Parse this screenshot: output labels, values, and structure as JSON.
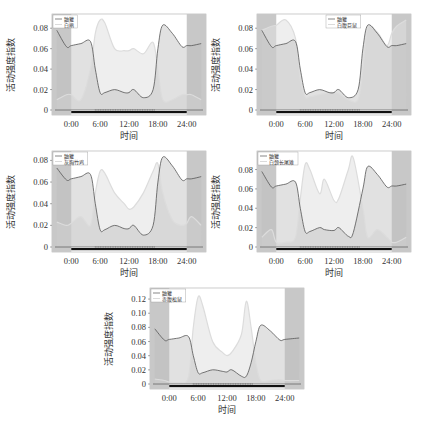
{
  "figure": {
    "ylabel": "活动强度指数",
    "xlabel": "时间",
    "x_ticks": [
      "0:00",
      "6:00",
      "12:00",
      "18:00",
      "24:00"
    ],
    "colors": {
      "night_shade": "#c8c8c8",
      "plot_bg": "#ffffff",
      "reference_line": "#555555",
      "reference_fill": "#bdbdbd",
      "species_line": "#e6e6e6",
      "species_fill": "#e0e0e0",
      "rug": "#111111"
    }
  },
  "chart_data": [
    {
      "type": "line",
      "title": "",
      "xlabel": "时间",
      "ylabel": "活动强度指数",
      "ylim": [
        0,
        0.09
      ],
      "y_ticks": [
        "0",
        "0.02",
        "0.04",
        "0.06",
        "0.08"
      ],
      "x_ticks": [
        "0:00",
        "6:00",
        "12:00",
        "18:00",
        "24:00"
      ],
      "legend": [
        "鼬獾",
        "白鹇"
      ],
      "legend_position": "upper-left",
      "x_hours": [
        -3,
        -1,
        0,
        2,
        4,
        5,
        6,
        7,
        9,
        11,
        12,
        13,
        15,
        17,
        18,
        19,
        21,
        23,
        24,
        25,
        27
      ],
      "series": [
        {
          "name": "鼬獾",
          "values": [
            0.078,
            0.062,
            0.063,
            0.065,
            0.067,
            0.04,
            0.017,
            0.017,
            0.02,
            0.017,
            0.017,
            0.02,
            0.012,
            0.02,
            0.06,
            0.083,
            0.075,
            0.062,
            0.063,
            0.063,
            0.065
          ]
        },
        {
          "name": "白鹇",
          "values": [
            0.01,
            0.015,
            0.015,
            0.01,
            0.04,
            0.075,
            0.088,
            0.085,
            0.06,
            0.058,
            0.058,
            0.06,
            0.055,
            0.066,
            0.04,
            0.01,
            0.01,
            0.015,
            0.015,
            0.015,
            0.01
          ]
        }
      ]
    },
    {
      "type": "line",
      "title": "",
      "xlabel": "时间",
      "ylabel": "活动强度指数",
      "ylim": [
        0,
        0.09
      ],
      "y_ticks": [
        "0",
        "0.02",
        "0.04",
        "0.06",
        "0.08"
      ],
      "x_ticks": [
        "0:00",
        "6:00",
        "12:00",
        "18:00",
        "24:00"
      ],
      "legend": [
        "鼬獾",
        "白腹巨鼠"
      ],
      "legend_position": "upper-center",
      "x_hours": [
        -3,
        -1,
        0,
        2,
        4,
        5,
        6,
        7,
        9,
        11,
        12,
        13,
        15,
        17,
        18,
        19,
        21,
        23,
        24,
        25,
        27
      ],
      "series": [
        {
          "name": "鼬獾",
          "values": [
            0.078,
            0.062,
            0.063,
            0.065,
            0.067,
            0.04,
            0.017,
            0.017,
            0.02,
            0.017,
            0.017,
            0.02,
            0.012,
            0.02,
            0.06,
            0.083,
            0.075,
            0.062,
            0.063,
            0.063,
            0.065
          ]
        },
        {
          "name": "白腹巨鼠",
          "values": [
            0.078,
            0.082,
            0.083,
            0.088,
            0.07,
            0.03,
            0.013,
            0.013,
            0.015,
            0.017,
            0.017,
            0.016,
            0.01,
            0.01,
            0.04,
            0.08,
            0.076,
            0.063,
            0.075,
            0.082,
            0.088
          ]
        }
      ]
    },
    {
      "type": "line",
      "title": "",
      "xlabel": "时间",
      "ylabel": "活动强度指数",
      "ylim": [
        0,
        0.085
      ],
      "y_ticks": [
        "0",
        "0.02",
        "0.04",
        "0.06",
        "0.08"
      ],
      "x_ticks": [
        "0:00",
        "6:00",
        "12:00",
        "18:00",
        "24:00"
      ],
      "legend": [
        "鼬獾",
        "灰胸竹鸡"
      ],
      "legend_position": "upper-left",
      "x_hours": [
        -3,
        -1,
        0,
        2,
        4,
        5,
        6,
        7,
        9,
        11,
        12,
        13,
        15,
        17,
        18,
        19,
        21,
        23,
        24,
        25,
        27
      ],
      "series": [
        {
          "name": "鼬獾",
          "values": [
            0.073,
            0.062,
            0.063,
            0.065,
            0.067,
            0.04,
            0.016,
            0.016,
            0.02,
            0.017,
            0.017,
            0.02,
            0.011,
            0.02,
            0.06,
            0.083,
            0.075,
            0.062,
            0.063,
            0.063,
            0.065
          ]
        },
        {
          "name": "灰胸竹鸡",
          "values": [
            0.023,
            0.02,
            0.022,
            0.028,
            0.02,
            0.05,
            0.07,
            0.068,
            0.05,
            0.04,
            0.035,
            0.037,
            0.05,
            0.07,
            0.077,
            0.05,
            0.025,
            0.02,
            0.022,
            0.028,
            0.02
          ]
        }
      ]
    },
    {
      "type": "line",
      "title": "",
      "xlabel": "时间",
      "ylabel": "活动强度指数",
      "ylim": [
        0,
        0.095
      ],
      "y_ticks": [
        "0",
        "0.02",
        "0.04",
        "0.06",
        "0.08"
      ],
      "x_ticks": [
        "0:00",
        "6:00",
        "12:00",
        "18:00",
        "24:00"
      ],
      "legend": [
        "鼬獾",
        "白颈长尾雉"
      ],
      "legend_position": "upper-left",
      "x_hours": [
        -3,
        -1,
        0,
        2,
        4,
        5,
        6,
        7,
        9,
        10,
        12,
        13,
        15,
        16,
        18,
        19,
        21,
        23,
        24,
        25,
        27
      ],
      "series": [
        {
          "name": "鼬獾",
          "values": [
            0.078,
            0.062,
            0.063,
            0.065,
            0.067,
            0.04,
            0.016,
            0.016,
            0.02,
            0.018,
            0.017,
            0.02,
            0.011,
            0.015,
            0.06,
            0.083,
            0.075,
            0.062,
            0.063,
            0.063,
            0.065
          ]
        },
        {
          "name": "白颈长尾雉",
          "values": [
            0.01,
            0.018,
            0.005,
            0.005,
            0.01,
            0.05,
            0.085,
            0.08,
            0.055,
            0.07,
            0.048,
            0.05,
            0.08,
            0.092,
            0.04,
            0.01,
            0.018,
            0.01,
            0.005,
            0.005,
            0.01
          ]
        }
      ]
    },
    {
      "type": "line",
      "title": "",
      "xlabel": "时间",
      "ylabel": "活动强度指数",
      "ylim": [
        0,
        0.13
      ],
      "y_ticks": [
        "0",
        "0.02",
        "0.04",
        "0.06",
        "0.08",
        "0.10",
        "0.12"
      ],
      "x_ticks": [
        "0:00",
        "6:00",
        "12:00",
        "18:00",
        "24:00"
      ],
      "legend": [
        "鼬獾",
        "赤腹松鼠"
      ],
      "legend_position": "upper-left",
      "x_hours": [
        -3,
        -1,
        0,
        2,
        4,
        5,
        6,
        7,
        9,
        11,
        12,
        13,
        15,
        16,
        17,
        18,
        19,
        21,
        23,
        24,
        27
      ],
      "series": [
        {
          "name": "鼬獾",
          "values": [
            0.078,
            0.062,
            0.063,
            0.065,
            0.067,
            0.04,
            0.016,
            0.016,
            0.02,
            0.018,
            0.017,
            0.02,
            0.011,
            0.011,
            0.03,
            0.06,
            0.083,
            0.075,
            0.062,
            0.063,
            0.065
          ]
        },
        {
          "name": "赤腹松鼠",
          "values": [
            0.007,
            0.005,
            0.003,
            0.002,
            0.01,
            0.08,
            0.123,
            0.11,
            0.06,
            0.045,
            0.04,
            0.045,
            0.07,
            0.117,
            0.08,
            0.03,
            0.005,
            0.005,
            0.006,
            0.005,
            0.005
          ]
        }
      ]
    }
  ],
  "panels": [
    {
      "legend": {
        "reference": "鼬獾",
        "species": "白鹇"
      }
    },
    {
      "legend": {
        "reference": "鼬獾",
        "species": "白腹巨鼠"
      }
    },
    {
      "legend": {
        "reference": "鼬獾",
        "species": "灰胸竹鸡"
      }
    },
    {
      "legend": {
        "reference": "鼬獾",
        "species": "白颈长尾雉"
      }
    },
    {
      "legend": {
        "reference": "鼬獾",
        "species": "赤腹松鼠"
      }
    }
  ]
}
